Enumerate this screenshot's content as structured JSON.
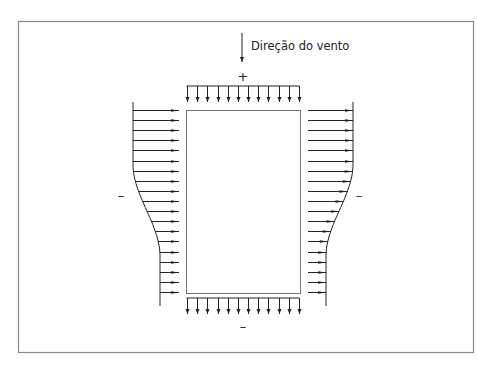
{
  "diagram": {
    "title": "",
    "wind_direction_label": "Direção do vento",
    "top_sign": "+",
    "bottom_sign": "–",
    "left_sign": "–",
    "right_sign": "–",
    "colors": {
      "frame": "#8a8a8a",
      "stroke": "#222222",
      "building": "#777777",
      "background": "#ffffff"
    },
    "building": {
      "x": 186,
      "y": 110,
      "width": 114,
      "height": 183
    },
    "top_arrows": {
      "count": 12,
      "x_start": 187,
      "x_end": 299,
      "line_y": 86,
      "tip_y": 102
    },
    "bottom_arrows": {
      "count": 12,
      "x_start": 187,
      "x_end": 299,
      "line_y": 298,
      "tip_y": 314
    },
    "side_arrows": {
      "rows": 19,
      "y_start": 110,
      "y_end": 292
    }
  }
}
